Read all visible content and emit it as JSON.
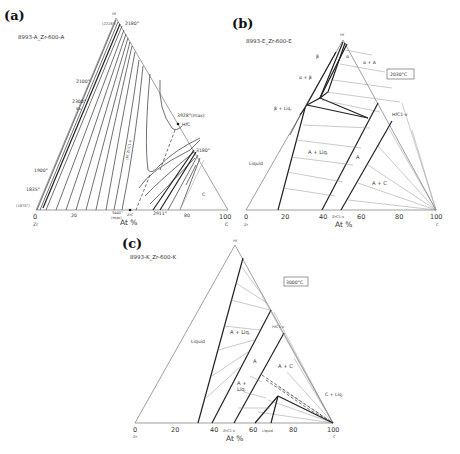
{
  "panels": {
    "a": {
      "letter": "(a)",
      "subtitle": "8993-A_Zr-600-A",
      "apex": "Hf",
      "apex_temp_left": "(2218°)",
      "apex_temp": "2180°",
      "left_corner": "Zr",
      "right_corner": "C",
      "left_corner_temp": "(1870°)",
      "ticks": [
        "0",
        "20",
        "80",
        "100"
      ],
      "axis_label": "At %",
      "labels": {
        "t2100": "2100°",
        "t2300": "2300°",
        "ba": "Ba",
        "t1900": "1900°",
        "t1835": "1835°",
        "t3928": "3928°(max)",
        "hfc": "HfC",
        "t3180": "3180°",
        "t3440": "3440°",
        "max": "(max)",
        "zrc": "ZrC",
        "t2911": "2911°",
        "c_region": "C",
        "phase": "(Hf,Zr)C1-x"
      },
      "isotherms": [
        "2100",
        "2300",
        "2500",
        "2700",
        "2900",
        "3100",
        "3300",
        "3500",
        "3500",
        "3300",
        "3100",
        "2900",
        "3000"
      ]
    },
    "b": {
      "letter": "(b)",
      "subtitle": "8993-E_Zr-600-E",
      "apex": "Hf",
      "temperature": "2030°C",
      "left_corner": "Zr",
      "right_corner": "C",
      "ticks": [
        "0",
        "20",
        "40",
        "60",
        "80",
        "100"
      ],
      "axis_label": "At %",
      "labels": {
        "beta": "β",
        "alpha": "α",
        "alpha_A": "α + A",
        "alpha_beta": "α + β",
        "beta_liq": "β + Liq.",
        "hfc": "HfC1-x",
        "a_liq": "A + Liq.",
        "liquid": "Liquid",
        "a": "A",
        "a_c": "A + C",
        "zrc": "ZrC1-x"
      }
    },
    "c": {
      "letter": "(c)",
      "subtitle": "8993-K_Zr-600-K",
      "apex": "Hf",
      "temperature": "3000°C",
      "left_corner": "Zr",
      "right_corner": "C",
      "ticks": [
        "0",
        "20",
        "40",
        "60",
        "80",
        "100"
      ],
      "axis_label": "At %",
      "labels": {
        "liquid": "Liquid",
        "a_liq": "A + Liq.",
        "hfc": "HfC1-x",
        "a": "A",
        "a_c": "A + C",
        "a_plus": "A +",
        "liq": "Liq.",
        "c_liq": "C + Liq.",
        "zrc": "ZrC1-x",
        "liquid2": "Liquid"
      }
    }
  }
}
